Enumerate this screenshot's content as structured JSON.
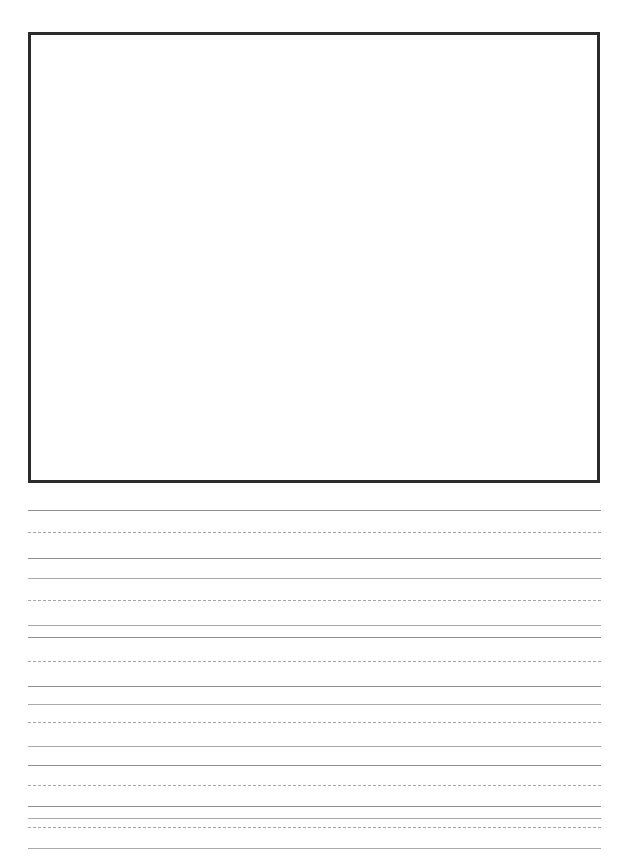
{
  "document": {
    "kind": "handwriting-practice-worksheet",
    "page_width": 629,
    "page_height": 860,
    "background_color": "#ffffff",
    "caption": ""
  },
  "drawing_box": {
    "label": "",
    "content": "",
    "left": 28,
    "top": 32,
    "width": 572,
    "height": 451,
    "border_color": "#2b2b2b",
    "border_width": 3,
    "fill_color": "#ffffff"
  },
  "ruling": {
    "left": 28,
    "right": 601,
    "line_length": 573,
    "group_period": 40,
    "solid_color": "#8f8f92",
    "solid_soft_color": "#a9a9ad",
    "dashed_color": "#a5a5aa",
    "groups": [
      {
        "index": 1,
        "top_line_y": 510,
        "mid_line_y": 532,
        "base_line_y": 558,
        "under_line_y": 578
      },
      {
        "index": 2,
        "top_line_y": 598,
        "mid_line_y": 618,
        "base_line_y": 632,
        "under_line_y": 652
      },
      {
        "index": 3,
        "top_line_y": 672,
        "mid_line_y": 690,
        "base_line_y": 712,
        "under_line_y": 730
      },
      {
        "index": 4,
        "top_line_y": 752,
        "mid_line_y": 770,
        "base_line_y": 790,
        "under_line_y": 808
      },
      {
        "index": 5,
        "top_line_y": 826,
        "mid_line_y": 844,
        "base_line_y": 0,
        "under_line_y": 0
      }
    ],
    "lines": [
      {
        "y": 510,
        "style": "solid"
      },
      {
        "y": 532,
        "style": "dashed"
      },
      {
        "y": 558,
        "style": "solid"
      },
      {
        "y": 578,
        "style": "solid"
      },
      {
        "y": 600,
        "style": "dashed"
      },
      {
        "y": 625,
        "style": "solid"
      },
      {
        "y": 637,
        "style": "solid"
      },
      {
        "y": 661,
        "style": "dashed"
      },
      {
        "y": 686,
        "style": "solid"
      },
      {
        "y": 704,
        "style": "solid"
      },
      {
        "y": 722,
        "style": "dashed"
      },
      {
        "y": 746,
        "style": "solid"
      },
      {
        "y": 765,
        "style": "solid"
      },
      {
        "y": 785,
        "style": "dashed"
      },
      {
        "y": 806,
        "style": "solid"
      },
      {
        "y": 818,
        "style": "solid"
      },
      {
        "y": 827,
        "style": "dashed"
      },
      {
        "y": 848,
        "style": "solid"
      }
    ]
  }
}
